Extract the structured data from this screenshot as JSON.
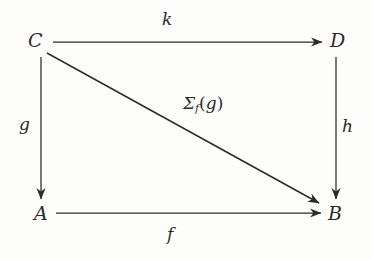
{
  "diagram": {
    "kind": "commutative-diagram",
    "title": "",
    "background_color": "#fdfdfc",
    "stroke_color": "#2b2b2b",
    "nodes": [
      {
        "id": "C",
        "label": "C",
        "x": 41,
        "y": 41
      },
      {
        "id": "D",
        "label": "D",
        "x": 338,
        "y": 41
      },
      {
        "id": "A",
        "label": "A",
        "x": 41,
        "y": 213
      },
      {
        "id": "B",
        "label": "B",
        "x": 336,
        "y": 213
      }
    ],
    "edges": [
      {
        "id": "k",
        "label": "k",
        "from": "C",
        "to": "D",
        "direction": "right",
        "arrowhead": "end",
        "label_position": "above"
      },
      {
        "id": "g",
        "label": "g",
        "from": "C",
        "to": "A",
        "direction": "down",
        "arrowhead": "end",
        "label_position": "left"
      },
      {
        "id": "h",
        "label": "h",
        "from": "D",
        "to": "B",
        "direction": "down",
        "arrowhead": "end",
        "label_position": "right"
      },
      {
        "id": "f",
        "label": "f",
        "from": "A",
        "to": "B",
        "direction": "right",
        "arrowhead": "end",
        "label_position": "below"
      },
      {
        "id": "sigma_f_g",
        "label": "Σf(g)",
        "label_sigma": "Σ",
        "label_subscript": "f",
        "label_open_paren": "(",
        "label_argument": "g",
        "label_close_paren": ")",
        "from": "C",
        "to": "B",
        "direction": "diagonal",
        "arrowhead": "end",
        "label_position": "above-right"
      }
    ]
  }
}
